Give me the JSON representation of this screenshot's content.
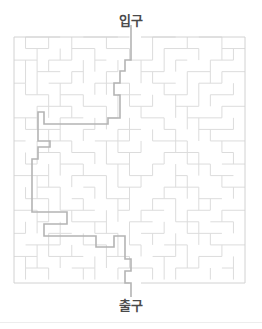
{
  "page": {
    "background_color": "#ffffff",
    "width": 262,
    "height": 329
  },
  "entrance": {
    "label": "입구",
    "text_color": "#4a4a4a"
  },
  "exit": {
    "label": "출구",
    "text_color": "#4a4a4a"
  },
  "maze": {
    "title": "maze-puzzle",
    "wall_color": "#dcdcdc",
    "border_color": "#d2d2d2",
    "solution_color": "#b4b4b4",
    "wall_width": 1,
    "solution_width": 1.6,
    "origin_x": 14,
    "origin_y": 37,
    "cell": 11.55,
    "cols": 20,
    "rows": 21,
    "entrance_col": 10,
    "exit_col": 10,
    "border": [
      "M 14 37 H 129.5",
      "M 141 37 H 245",
      "M 14 283 H 129.5",
      "M 141 283 H 245",
      "M 14 37 V 283",
      "M 245 37 V 283"
    ],
    "h_walls": [
      [
        0,
        1,
        4
      ],
      [
        0,
        6,
        9
      ],
      [
        0,
        12,
        14
      ],
      [
        0,
        16,
        18
      ],
      [
        1,
        1,
        3
      ],
      [
        1,
        5,
        7
      ],
      [
        1,
        8,
        10
      ],
      [
        1,
        13,
        16
      ],
      [
        1,
        18,
        20
      ],
      [
        2,
        0,
        2
      ],
      [
        2,
        3,
        5
      ],
      [
        2,
        7,
        8
      ],
      [
        2,
        10,
        12
      ],
      [
        2,
        14,
        15
      ],
      [
        2,
        17,
        19
      ],
      [
        3,
        2,
        4
      ],
      [
        3,
        5,
        6
      ],
      [
        3,
        8,
        9
      ],
      [
        3,
        11,
        13
      ],
      [
        3,
        15,
        17
      ],
      [
        3,
        18,
        20
      ],
      [
        4,
        0,
        1
      ],
      [
        4,
        3,
        5
      ],
      [
        4,
        7,
        10
      ],
      [
        4,
        12,
        14
      ],
      [
        4,
        16,
        18
      ],
      [
        5,
        1,
        3
      ],
      [
        5,
        4,
        6
      ],
      [
        5,
        9,
        11
      ],
      [
        5,
        13,
        15
      ],
      [
        5,
        17,
        19
      ],
      [
        6,
        2,
        5
      ],
      [
        6,
        6,
        8
      ],
      [
        6,
        10,
        12
      ],
      [
        6,
        14,
        16
      ],
      [
        6,
        18,
        20
      ],
      [
        7,
        0,
        2
      ],
      [
        7,
        4,
        6
      ],
      [
        7,
        8,
        9
      ],
      [
        7,
        11,
        13
      ],
      [
        7,
        15,
        18
      ],
      [
        8,
        1,
        4
      ],
      [
        8,
        6,
        7
      ],
      [
        8,
        9,
        11
      ],
      [
        8,
        13,
        14
      ],
      [
        8,
        16,
        19
      ],
      [
        9,
        0,
        1
      ],
      [
        9,
        3,
        5
      ],
      [
        9,
        7,
        10
      ],
      [
        9,
        12,
        15
      ],
      [
        9,
        17,
        20
      ],
      [
        10,
        2,
        4
      ],
      [
        10,
        5,
        7
      ],
      [
        10,
        9,
        11
      ],
      [
        10,
        13,
        16
      ],
      [
        10,
        18,
        19
      ],
      [
        11,
        1,
        2
      ],
      [
        11,
        4,
        6
      ],
      [
        11,
        8,
        10
      ],
      [
        11,
        12,
        13
      ],
      [
        11,
        15,
        17
      ],
      [
        11,
        18,
        20
      ],
      [
        12,
        0,
        3
      ],
      [
        12,
        5,
        8
      ],
      [
        12,
        10,
        12
      ],
      [
        12,
        14,
        15
      ],
      [
        12,
        17,
        19
      ],
      [
        13,
        2,
        4
      ],
      [
        13,
        6,
        7
      ],
      [
        13,
        9,
        11
      ],
      [
        13,
        13,
        16
      ],
      [
        13,
        18,
        20
      ],
      [
        14,
        1,
        3
      ],
      [
        14,
        5,
        6
      ],
      [
        14,
        8,
        10
      ],
      [
        14,
        12,
        14
      ],
      [
        14,
        16,
        18
      ],
      [
        15,
        0,
        2
      ],
      [
        15,
        4,
        7
      ],
      [
        15,
        9,
        10
      ],
      [
        15,
        11,
        13
      ],
      [
        15,
        15,
        17
      ],
      [
        15,
        18,
        20
      ],
      [
        16,
        2,
        3
      ],
      [
        16,
        5,
        8
      ],
      [
        16,
        10,
        12
      ],
      [
        16,
        14,
        16
      ],
      [
        16,
        17,
        19
      ],
      [
        17,
        0,
        1
      ],
      [
        17,
        3,
        5
      ],
      [
        17,
        7,
        9
      ],
      [
        17,
        11,
        13
      ],
      [
        17,
        15,
        18
      ],
      [
        18,
        1,
        4
      ],
      [
        18,
        6,
        8
      ],
      [
        18,
        10,
        11
      ],
      [
        18,
        13,
        15
      ],
      [
        18,
        17,
        20
      ],
      [
        19,
        0,
        2
      ],
      [
        19,
        3,
        6
      ],
      [
        19,
        8,
        10
      ],
      [
        19,
        12,
        14
      ],
      [
        19,
        16,
        18
      ],
      [
        20,
        1,
        3
      ],
      [
        20,
        5,
        7
      ],
      [
        20,
        9,
        12
      ],
      [
        20,
        14,
        16
      ],
      [
        20,
        18,
        19
      ]
    ],
    "v_walls": [
      [
        1,
        0,
        1
      ],
      [
        3,
        0,
        1
      ],
      [
        5,
        0,
        2
      ],
      [
        8,
        0,
        1
      ],
      [
        12,
        0,
        2
      ],
      [
        15,
        0,
        1
      ],
      [
        18,
        0,
        2
      ],
      [
        2,
        1,
        3
      ],
      [
        4,
        1,
        2
      ],
      [
        7,
        1,
        3
      ],
      [
        10,
        1,
        2
      ],
      [
        13,
        1,
        3
      ],
      [
        16,
        1,
        2
      ],
      [
        19,
        1,
        2
      ],
      [
        1,
        2,
        4
      ],
      [
        3,
        2,
        3
      ],
      [
        6,
        2,
        4
      ],
      [
        9,
        2,
        3
      ],
      [
        11,
        2,
        4
      ],
      [
        14,
        2,
        3
      ],
      [
        17,
        2,
        4
      ],
      [
        2,
        3,
        5
      ],
      [
        5,
        3,
        4
      ],
      [
        8,
        3,
        5
      ],
      [
        12,
        3,
        4
      ],
      [
        15,
        3,
        5
      ],
      [
        18,
        3,
        4
      ],
      [
        1,
        4,
        5
      ],
      [
        4,
        4,
        6
      ],
      [
        7,
        4,
        5
      ],
      [
        10,
        4,
        6
      ],
      [
        13,
        4,
        5
      ],
      [
        16,
        4,
        6
      ],
      [
        19,
        4,
        5
      ],
      [
        3,
        5,
        7
      ],
      [
        6,
        5,
        6
      ],
      [
        9,
        5,
        7
      ],
      [
        12,
        5,
        6
      ],
      [
        14,
        5,
        7
      ],
      [
        17,
        5,
        6
      ],
      [
        2,
        6,
        8
      ],
      [
        5,
        6,
        7
      ],
      [
        8,
        6,
        8
      ],
      [
        11,
        6,
        7
      ],
      [
        15,
        6,
        8
      ],
      [
        18,
        6,
        7
      ],
      [
        1,
        7,
        8
      ],
      [
        4,
        7,
        9
      ],
      [
        7,
        7,
        8
      ],
      [
        10,
        7,
        9
      ],
      [
        13,
        7,
        8
      ],
      [
        16,
        7,
        9
      ],
      [
        19,
        7,
        8
      ],
      [
        3,
        8,
        10
      ],
      [
        6,
        8,
        9
      ],
      [
        9,
        8,
        10
      ],
      [
        12,
        8,
        9
      ],
      [
        14,
        8,
        10
      ],
      [
        17,
        8,
        9
      ],
      [
        2,
        9,
        11
      ],
      [
        5,
        9,
        10
      ],
      [
        8,
        9,
        11
      ],
      [
        11,
        9,
        10
      ],
      [
        15,
        9,
        11
      ],
      [
        18,
        9,
        10
      ],
      [
        1,
        10,
        11
      ],
      [
        4,
        10,
        12
      ],
      [
        7,
        10,
        11
      ],
      [
        10,
        10,
        12
      ],
      [
        13,
        10,
        11
      ],
      [
        16,
        10,
        12
      ],
      [
        19,
        10,
        11
      ],
      [
        3,
        11,
        13
      ],
      [
        6,
        11,
        12
      ],
      [
        9,
        11,
        13
      ],
      [
        12,
        11,
        12
      ],
      [
        14,
        11,
        13
      ],
      [
        17,
        11,
        12
      ],
      [
        2,
        12,
        14
      ],
      [
        5,
        12,
        13
      ],
      [
        8,
        12,
        14
      ],
      [
        11,
        12,
        13
      ],
      [
        15,
        12,
        14
      ],
      [
        18,
        12,
        13
      ],
      [
        1,
        13,
        14
      ],
      [
        4,
        13,
        15
      ],
      [
        7,
        13,
        14
      ],
      [
        10,
        13,
        15
      ],
      [
        13,
        13,
        14
      ],
      [
        16,
        13,
        15
      ],
      [
        19,
        13,
        14
      ],
      [
        3,
        14,
        16
      ],
      [
        6,
        14,
        15
      ],
      [
        9,
        14,
        16
      ],
      [
        12,
        14,
        15
      ],
      [
        14,
        14,
        16
      ],
      [
        17,
        14,
        15
      ],
      [
        2,
        15,
        17
      ],
      [
        5,
        15,
        16
      ],
      [
        8,
        15,
        17
      ],
      [
        11,
        15,
        16
      ],
      [
        15,
        15,
        17
      ],
      [
        18,
        15,
        16
      ],
      [
        1,
        16,
        17
      ],
      [
        4,
        16,
        18
      ],
      [
        7,
        16,
        17
      ],
      [
        10,
        16,
        18
      ],
      [
        13,
        16,
        17
      ],
      [
        16,
        16,
        18
      ],
      [
        19,
        16,
        17
      ],
      [
        3,
        17,
        19
      ],
      [
        6,
        17,
        18
      ],
      [
        9,
        17,
        19
      ],
      [
        12,
        17,
        18
      ],
      [
        14,
        17,
        19
      ],
      [
        17,
        17,
        18
      ],
      [
        2,
        18,
        20
      ],
      [
        5,
        18,
        19
      ],
      [
        8,
        18,
        20
      ],
      [
        11,
        18,
        19
      ],
      [
        15,
        18,
        20
      ],
      [
        18,
        18,
        19
      ],
      [
        1,
        19,
        21
      ],
      [
        4,
        19,
        20
      ],
      [
        7,
        19,
        21
      ],
      [
        10,
        19,
        20
      ],
      [
        13,
        19,
        21
      ],
      [
        16,
        19,
        20
      ],
      [
        19,
        19,
        21
      ],
      [
        3,
        20,
        21
      ],
      [
        6,
        20,
        21
      ],
      [
        9,
        20,
        21
      ],
      [
        12,
        20,
        21
      ],
      [
        14,
        20,
        21
      ],
      [
        17,
        20,
        21
      ]
    ],
    "solution_points": [
      [
        131,
        25
      ],
      [
        131,
        60
      ],
      [
        125,
        60
      ],
      [
        125,
        71
      ],
      [
        120,
        71
      ],
      [
        120,
        83
      ],
      [
        114,
        83
      ],
      [
        114,
        95
      ],
      [
        120,
        95
      ],
      [
        120,
        118
      ],
      [
        108,
        118
      ],
      [
        108,
        124
      ],
      [
        44,
        124
      ],
      [
        44,
        112
      ],
      [
        38,
        112
      ],
      [
        38,
        141
      ],
      [
        50,
        141
      ],
      [
        50,
        147
      ],
      [
        38,
        147
      ],
      [
        38,
        159
      ],
      [
        32,
        159
      ],
      [
        32,
        212
      ],
      [
        67,
        212
      ],
      [
        67,
        224
      ],
      [
        44,
        224
      ],
      [
        44,
        236
      ],
      [
        96,
        236
      ],
      [
        96,
        247
      ],
      [
        114,
        247
      ],
      [
        114,
        236
      ],
      [
        125,
        236
      ],
      [
        125,
        259
      ],
      [
        131,
        259
      ],
      [
        131,
        271
      ],
      [
        125,
        271
      ],
      [
        125,
        283
      ],
      [
        131,
        283
      ],
      [
        131,
        297
      ]
    ]
  },
  "footer": {
    "divider_color": "#ededed"
  }
}
